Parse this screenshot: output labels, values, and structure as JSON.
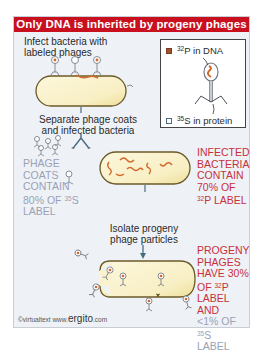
{
  "title": "Only DNA is inherited by progeny phages",
  "steps": {
    "step1": [
      "Infect bacteria with",
      "labeled phages"
    ],
    "step2": [
      "Separate phage coats",
      "and infected bacteria"
    ],
    "step3": [
      "Isolate progeny",
      "phage particles"
    ]
  },
  "legend": {
    "dna_label_sup": "32",
    "dna_label_rest": "P in DNA",
    "protein_label_sup": "35",
    "protein_label_rest": "S in protein",
    "dna_color": "#a0522d",
    "protein_color": "#ffffff"
  },
  "results": {
    "phage_coats": {
      "lines": [
        "PHAGE",
        "COATS",
        "CONTAIN",
        "80% OF "
      ],
      "sup": "35",
      "tail": "S",
      "last": "LABEL",
      "color": "#9aa1b5"
    },
    "infected_bacteria": {
      "lines": [
        "INFECTED",
        "BACTERIA",
        "CONTAIN",
        "70% OF"
      ],
      "sup": "32",
      "tail": "P LABEL",
      "color": "#c8303a"
    },
    "progeny_phages": {
      "lines": [
        "PROGENY",
        "PHAGES",
        "HAVE 30%",
        "OF "
      ],
      "sup": "32",
      "tail": "P",
      "line5": "LABEL AND",
      "grey_line": "<1% OF ",
      "grey_sup": "35",
      "grey_tail": "S",
      "grey_last": "LABEL"
    }
  },
  "footer": {
    "copyright": "©virtualtext  www.",
    "brand": "ergito",
    "domain": ".com"
  },
  "colors": {
    "title_bg": "#c8101e",
    "panel_bg": "#eef2f7",
    "bacterium_fill": "#fbf3cf",
    "dna": "#d2692a",
    "arrow": "#4a6b80"
  }
}
